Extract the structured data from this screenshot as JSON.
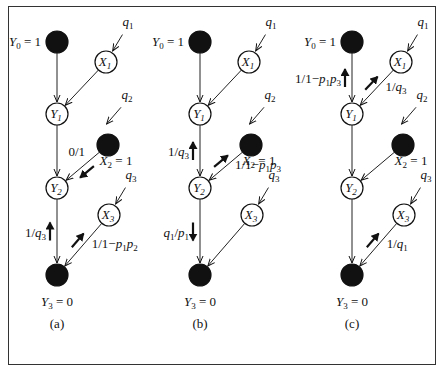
{
  "figure": {
    "panels": [
      {
        "caption": "(a)",
        "nodes": {
          "Y0": {
            "label": "Y0 = 1",
            "filled": true
          },
          "Y1": {
            "label": "Y1",
            "filled": false
          },
          "Y2": {
            "label": "Y2",
            "filled": false
          },
          "Y3": {
            "label": "Y3 = 0",
            "filled": true
          },
          "X1": {
            "label": "X1",
            "filled": false
          },
          "X2": {
            "label": "X2 = 1",
            "filled": true
          },
          "X3": {
            "label": "X3",
            "filled": false
          }
        },
        "inputs": [
          "q1",
          "q2",
          "q3"
        ],
        "messages": [
          {
            "edge": "X2-Y2",
            "label": "0/1",
            "direction": "toward Y2"
          },
          {
            "edge": "Y2-Y3",
            "label": "1/q3",
            "direction": "up toward Y2"
          },
          {
            "edge": "X3-Y3",
            "label": "1/1−p1p2",
            "direction": "toward X3"
          }
        ]
      },
      {
        "caption": "(b)",
        "nodes": {
          "Y0": {
            "label": "Y0 = 1",
            "filled": true
          },
          "Y1": {
            "label": "Y1",
            "filled": false
          },
          "Y2": {
            "label": "Y2",
            "filled": false
          },
          "Y3": {
            "label": "Y3 = 0",
            "filled": true
          },
          "X1": {
            "label": "X1",
            "filled": false
          },
          "X2": {
            "label": "X2 = 1",
            "filled": true
          },
          "X3": {
            "label": "X3",
            "filled": false
          }
        },
        "inputs": [
          "q1",
          "q2",
          "q3"
        ],
        "messages": [
          {
            "edge": "Y1-Y2",
            "label": "1/q3",
            "direction": "up toward Y1"
          },
          {
            "edge": "X2-Y2",
            "label": "1/1−p1p3",
            "direction": "toward X2"
          },
          {
            "edge": "Y2-Y3",
            "label": "q1/p1",
            "direction": "down toward Y3"
          }
        ]
      },
      {
        "caption": "(c)",
        "nodes": {
          "Y0": {
            "label": "Y0 = 1",
            "filled": true
          },
          "Y1": {
            "label": "Y1",
            "filled": false
          },
          "Y2": {
            "label": "Y2",
            "filled": false
          },
          "Y3": {
            "label": "Y3 = 0",
            "filled": true
          },
          "X1": {
            "label": "X1",
            "filled": false
          },
          "X2": {
            "label": "X2 = 1",
            "filled": true
          },
          "X3": {
            "label": "X3",
            "filled": false
          }
        },
        "inputs": [
          "q1",
          "q2",
          "q3"
        ],
        "messages": [
          {
            "edge": "Y0-Y1",
            "label": "1/1−p1p3",
            "direction": "up toward Y0"
          },
          {
            "edge": "X1-Y1",
            "label": "1/q3",
            "direction": "toward X1"
          },
          {
            "edge": "X3-Y3",
            "label": "1/q1",
            "direction": "toward X3"
          }
        ]
      }
    ]
  }
}
